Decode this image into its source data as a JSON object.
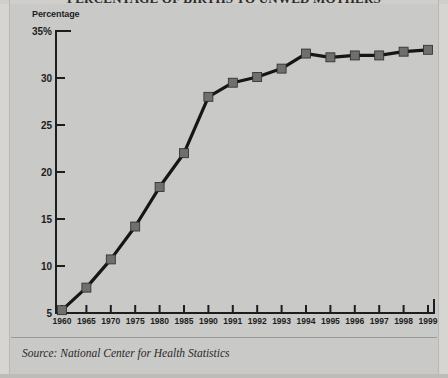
{
  "figure": {
    "title_clipped": "PERCENTAGE OF BIRTHS TO UNWED MOTHERS",
    "y_axis_title": "Percentage",
    "source_note": "Source: National Center for Health Statistics"
  },
  "colors": {
    "background": "#c9c9c7",
    "line": "#161616",
    "marker": "#6f6f6f",
    "marker_border": "#2a2a2a",
    "axis": "#1d1d1d",
    "text": "#1d1d1d",
    "frame": "#b9b8b5",
    "rule": "#9a9997"
  },
  "chart_data": {
    "type": "line",
    "title": "PERCENTAGE OF BIRTHS TO UNWED MOTHERS",
    "xlabel": "",
    "ylabel": "Percentage",
    "ylim": [
      5,
      35
    ],
    "yticks": [
      5,
      10,
      15,
      20,
      25,
      30,
      35
    ],
    "ytick_labels": [
      "5",
      "10",
      "15",
      "20",
      "25",
      "30",
      "35%"
    ],
    "grid": false,
    "legend": null,
    "categories": [
      "1960",
      "1965",
      "1970",
      "1975",
      "1980",
      "1985",
      "1990",
      "1991",
      "1992",
      "1993",
      "1994",
      "1995",
      "1996",
      "1997",
      "1998",
      "1999"
    ],
    "values": [
      5.3,
      7.7,
      10.7,
      14.2,
      18.4,
      22.0,
      28.0,
      29.5,
      30.1,
      31.0,
      32.6,
      32.2,
      32.4,
      32.4,
      32.8,
      33.0
    ],
    "series": [
      {
        "name": "Percentage of births to unwed mothers",
        "values": [
          5.3,
          7.7,
          10.7,
          14.2,
          18.4,
          22.0,
          28.0,
          29.5,
          30.1,
          31.0,
          32.6,
          32.2,
          32.4,
          32.4,
          32.8,
          33.0
        ]
      }
    ]
  }
}
